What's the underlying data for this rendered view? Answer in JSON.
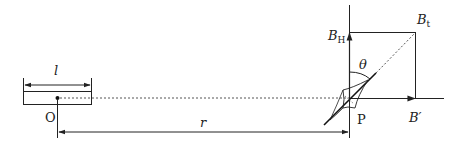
{
  "diagram": {
    "labels": {
      "length": "l",
      "origin": "O",
      "distance": "r",
      "point": "P",
      "angle": "θ",
      "bh_main": "B",
      "bh_sub": "H",
      "bt_main": "B",
      "bt_sub": "t",
      "bprime": "B′"
    },
    "colors": {
      "line": "#222222",
      "dotted": "#555555"
    }
  }
}
